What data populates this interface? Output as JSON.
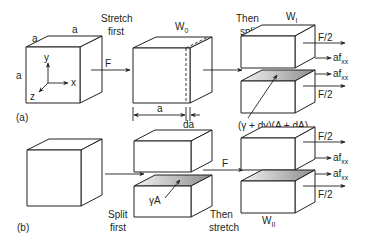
{
  "figure": {
    "panel_a": {
      "label": "(a)",
      "cube": {
        "edge_top_left": "a",
        "edge_top_right": "a",
        "edge_left": "a"
      },
      "axes": {
        "x": "x",
        "y": "y",
        "z": "z"
      },
      "step1": {
        "line1": "Stretch",
        "line2": "first"
      },
      "force": "F",
      "stretched_cube": {
        "title": "W",
        "title_sub": "0",
        "width_label": "a",
        "increment_label": "da"
      },
      "step2": {
        "line1": "Then",
        "line2": "split"
      },
      "result": {
        "title": "W",
        "title_sub": "I",
        "upper_force": "F/2",
        "upper_traction": "af",
        "upper_traction_sub": "xx",
        "lower_traction": "af",
        "lower_traction_sub": "xx",
        "lower_force": "F/2",
        "surface_energy": "(γ + dγ)(A + dA)"
      }
    },
    "panel_b": {
      "label": "(b)",
      "step1": {
        "line1": "Split",
        "line2": "first"
      },
      "surface_energy": "γA",
      "force": "F",
      "step2": {
        "line1": "Then",
        "line2": "stretch"
      },
      "result": {
        "title": "W",
        "title_sub": "II",
        "upper_force": "F/2",
        "upper_traction": "af",
        "upper_traction_sub": "xx",
        "lower_traction": "af",
        "lower_traction_sub": "xx",
        "lower_force": "F/2"
      }
    },
    "colors": {
      "ink": "#231f20",
      "face": "#ffffff",
      "shade_dark": "#8a8a8a",
      "shade_light": "#f2f2f2"
    }
  }
}
